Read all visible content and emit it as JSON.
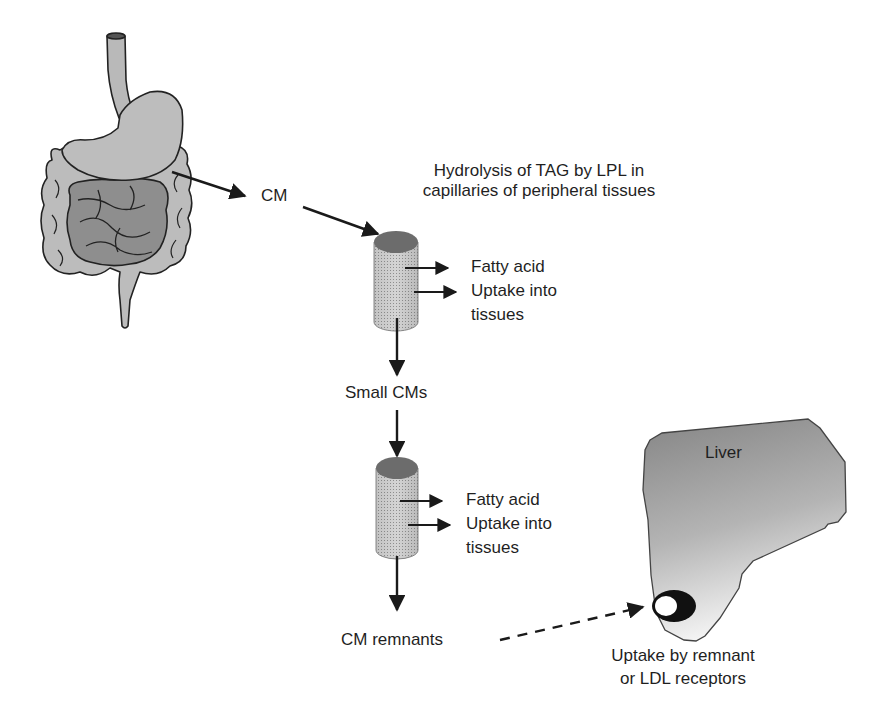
{
  "diagram": {
    "nodes": {
      "gut": {
        "label": "Gastrointestinal tract",
        "icon": "digestive-system-icon"
      },
      "cm": {
        "label": "CM"
      },
      "hydrolysis_note": {
        "line1": "Hydrolysis of TAG by LPL in",
        "line2": "capillaries of peripheral tissues"
      },
      "capillary1": {
        "icon": "capillary-cylinder-icon",
        "out1": "Fatty acid",
        "out2_line1": "Uptake into",
        "out2_line2": "tissues"
      },
      "small_cms": {
        "label": "Small CMs"
      },
      "capillary2": {
        "icon": "capillary-cylinder-icon",
        "out1": "Fatty acid",
        "out2_line1": "Uptake into",
        "out2_line2": "tissues"
      },
      "cm_remnants": {
        "label": "CM remnants"
      },
      "liver": {
        "label": "Liver",
        "icon": "liver-icon",
        "receptor_icon": "receptor-icon"
      },
      "liver_uptake": {
        "line1": "Uptake by remnant",
        "line2": "or LDL receptors"
      }
    },
    "edges": [
      {
        "from": "gut",
        "to": "cm",
        "style": "solid"
      },
      {
        "from": "cm",
        "to": "capillary1",
        "style": "solid"
      },
      {
        "from": "capillary1",
        "to": "fatty_acid_1",
        "style": "solid"
      },
      {
        "from": "capillary1",
        "to": "uptake_1",
        "style": "solid"
      },
      {
        "from": "capillary1",
        "to": "small_cms",
        "style": "solid"
      },
      {
        "from": "small_cms",
        "to": "capillary2",
        "style": "solid"
      },
      {
        "from": "capillary2",
        "to": "fatty_acid_2",
        "style": "solid"
      },
      {
        "from": "capillary2",
        "to": "uptake_2",
        "style": "solid"
      },
      {
        "from": "capillary2",
        "to": "cm_remnants",
        "style": "solid"
      },
      {
        "from": "cm_remnants",
        "to": "liver",
        "style": "dashed"
      }
    ],
    "colors": {
      "organ_fill": "#b9b9b9",
      "organ_dark": "#8a8a8a",
      "cylinder_top": "#6f6f6f",
      "cylinder_body": "#c8c8c8",
      "liver_fill_top": "#8c8c8c",
      "liver_fill_bottom": "#f0f0f0",
      "arrow": "#1a1a1a"
    }
  }
}
